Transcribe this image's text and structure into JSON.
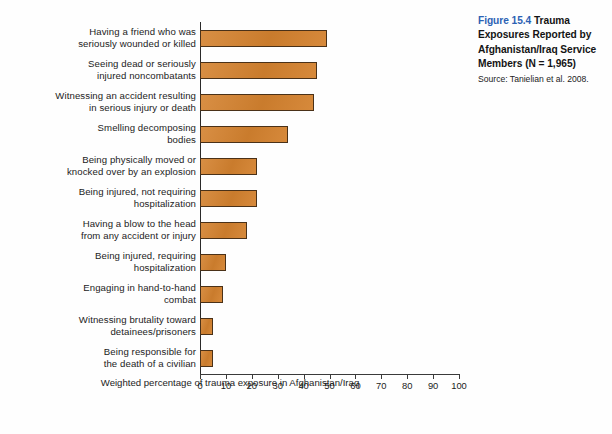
{
  "caption": {
    "figure_number": "Figure 15.4",
    "title": "Trauma Exposures Reported by Afghanistan/Iraq Service Members (N = 1,965)",
    "title_lines": [
      "Trauma",
      "Exposures Reported by",
      "Afghanistan/Iraq Service",
      "Members (N = 1,965)"
    ],
    "source": "Source: Tanielian et al. 2008.",
    "figure_number_color": "#2c62b4"
  },
  "chart_data": {
    "type": "bar",
    "orientation": "horizontal",
    "title": "Trauma Exposures Reported by Afghanistan/Iraq Service Members (N = 1,965)",
    "xlabel": "Weighted percentage of trauma exposure in Afghanistan/Iraq",
    "ylabel": "",
    "xlim": [
      0,
      100
    ],
    "xticks": [
      0,
      10,
      20,
      30,
      40,
      50,
      60,
      70,
      80,
      90,
      100
    ],
    "xtick_labels": [
      "0",
      "10",
      "20",
      "30",
      "40",
      "50",
      "60",
      "70",
      "80",
      "90",
      "100"
    ],
    "grid": false,
    "legend": "none",
    "bar_color": "#d4822f",
    "bar_edge_color": "#4a3118",
    "categories": [
      "Having a friend who was seriously wounded or killed",
      "Seeing dead or seriously injured noncombatants",
      "Witnessing an accident resulting in serious injury or death",
      "Smelling decomposing bodies",
      "Being physically moved or knocked over by an explosion",
      "Being injured, not requiring hospitalization",
      "Having a blow to the head from any accident or injury",
      "Being injured, requiring hospitalization",
      "Engaging in hand-to-hand combat",
      "Witnessing brutality toward detainees/prisoners",
      "Being responsible for the death of a civilian"
    ],
    "category_lines": [
      [
        "Having a friend who was",
        "seriously wounded or killed"
      ],
      [
        "Seeing dead or seriously",
        "injured noncombatants"
      ],
      [
        "Witnessing an accident resulting",
        "in serious injury or death"
      ],
      [
        "Smelling decomposing",
        "bodies"
      ],
      [
        "Being physically moved or",
        "knocked over by an explosion"
      ],
      [
        "Being injured, not requiring",
        "hospitalization"
      ],
      [
        "Having a blow to the head",
        "from any accident or injury"
      ],
      [
        "Being injured, requiring",
        "hospitalization"
      ],
      [
        "Engaging in hand-to-hand",
        "combat"
      ],
      [
        "Witnessing brutality toward",
        "detainees/prisoners"
      ],
      [
        "Being responsible for",
        "the death of a civilian"
      ]
    ],
    "values": [
      49,
      45,
      44,
      34,
      22,
      22,
      18,
      10,
      9,
      5,
      5
    ]
  }
}
